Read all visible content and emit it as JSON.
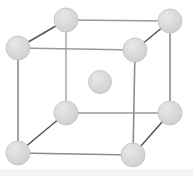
{
  "figure": {
    "background_color": "#ffffff",
    "canvas": {
      "width": 193,
      "height": 176
    }
  },
  "style": {
    "atom_fill": "#d6d6d6",
    "atom_fill_light": "#e2e2e2",
    "atom_stroke": "#c2c2c2",
    "edge_front_color": "#8c8c8c",
    "edge_back_color": "#9a9a9a",
    "edge_diagonal_color": "#555555",
    "edge_front_width": 1.6,
    "edge_back_width": 1.3,
    "edge_diagonal_width": 1.5,
    "atom_radius_corner": 12,
    "atom_radius_center": 11.5,
    "bottom_band_color": "#f4f4f4"
  },
  "chart_data": {
    "type": "scatter",
    "xlabel": "",
    "ylabel": "",
    "grid": false,
    "legend": false,
    "atoms": [
      {
        "id": "corner-back-top-left",
        "label": "corner",
        "x": 18,
        "y": 48,
        "r": 12,
        "role": "corner",
        "lattice": [
          0,
          1,
          1
        ]
      },
      {
        "id": "corner-back-top-right",
        "label": "corner",
        "x": 66,
        "y": 20,
        "r": 12,
        "role": "corner",
        "lattice": [
          1,
          1,
          1
        ]
      },
      {
        "id": "corner-front-top-left",
        "label": "corner",
        "x": 170,
        "y": 21,
        "r": 12,
        "role": "corner",
        "lattice": [
          1,
          1,
          0
        ]
      },
      {
        "id": "corner-front-top-right",
        "label": "corner",
        "x": 135,
        "y": 50,
        "r": 12,
        "role": "corner",
        "lattice": [
          0,
          1,
          0
        ]
      },
      {
        "id": "corner-back-bottom-left",
        "label": "corner",
        "x": 18,
        "y": 153,
        "r": 12,
        "role": "corner",
        "lattice": [
          0,
          0,
          1
        ]
      },
      {
        "id": "corner-back-bottom-right",
        "label": "corner",
        "x": 66,
        "y": 113,
        "r": 12,
        "role": "corner",
        "lattice": [
          1,
          0,
          1
        ]
      },
      {
        "id": "corner-front-bottom-left",
        "label": "corner",
        "x": 170,
        "y": 113,
        "r": 12,
        "role": "corner",
        "lattice": [
          1,
          0,
          0
        ]
      },
      {
        "id": "corner-front-bottom-right",
        "label": "corner",
        "x": 133,
        "y": 155,
        "r": 12,
        "role": "corner",
        "lattice": [
          0,
          0,
          0
        ]
      },
      {
        "id": "body-center",
        "label": "body center",
        "x": 100,
        "y": 82,
        "r": 11.5,
        "role": "center",
        "lattice": [
          0.5,
          0.5,
          0.5
        ]
      }
    ],
    "edges": [
      {
        "id": "edge-top-back",
        "from": "corner-back-top-left",
        "to": "corner-back-top-right",
        "kind": "diagonal"
      },
      {
        "id": "edge-top-rear-right",
        "from": "corner-back-top-right",
        "to": "corner-front-top-left",
        "kind": "back"
      },
      {
        "id": "edge-top-front-right",
        "from": "corner-front-top-left",
        "to": "corner-front-top-right",
        "kind": "diagonal"
      },
      {
        "id": "edge-top-front-left",
        "from": "corner-front-top-right",
        "to": "corner-back-top-left",
        "kind": "back"
      },
      {
        "id": "edge-bottom-back",
        "from": "corner-back-bottom-left",
        "to": "corner-back-bottom-right",
        "kind": "diagonal"
      },
      {
        "id": "edge-bottom-rear",
        "from": "corner-back-bottom-right",
        "to": "corner-front-bottom-left",
        "kind": "back"
      },
      {
        "id": "edge-bottom-right",
        "from": "corner-front-bottom-left",
        "to": "corner-front-bottom-right",
        "kind": "diagonal"
      },
      {
        "id": "edge-bottom-front",
        "from": "corner-front-bottom-right",
        "to": "corner-back-bottom-left",
        "kind": "front"
      },
      {
        "id": "edge-vert-left",
        "from": "corner-back-top-left",
        "to": "corner-back-bottom-left",
        "kind": "front"
      },
      {
        "id": "edge-vert-back",
        "from": "corner-back-top-right",
        "to": "corner-back-bottom-right",
        "kind": "back"
      },
      {
        "id": "edge-vert-far-right",
        "from": "corner-front-top-left",
        "to": "corner-front-bottom-left",
        "kind": "front"
      },
      {
        "id": "edge-vert-front",
        "from": "corner-front-top-right",
        "to": "corner-front-bottom-right",
        "kind": "front"
      }
    ]
  }
}
